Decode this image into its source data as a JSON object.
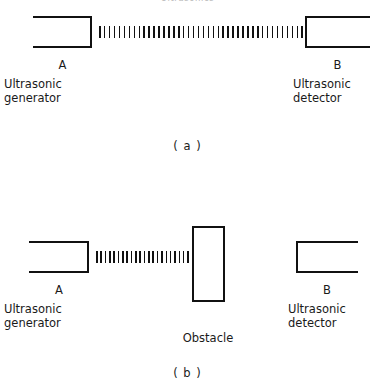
{
  "figure": {
    "top_clipped_caption": "Ultrasonics",
    "background_color": "#ffffff",
    "line_color": "#111111"
  },
  "panel_a": {
    "caption": "( a )",
    "generator": {
      "letter": "A",
      "caption_line_1": "Ultrasonic",
      "caption_line_2": "generator"
    },
    "detector": {
      "letter": "B",
      "caption_line_1": "Ultrasonic",
      "caption_line_2": "detector"
    },
    "wave": {
      "tick_count": 42,
      "label": "ultrasonic-wave-train"
    }
  },
  "panel_b": {
    "caption": "( b )",
    "generator": {
      "letter": "A",
      "caption_line_1": "Ultrasonic",
      "caption_line_2": "generator"
    },
    "detector": {
      "letter": "B",
      "caption_line_1": "Ultrasonic",
      "caption_line_2": "detector"
    },
    "obstacle": {
      "caption": "Obstacle"
    },
    "wave": {
      "tick_count": 22,
      "label": "ultrasonic-wave-train-blocked"
    }
  }
}
